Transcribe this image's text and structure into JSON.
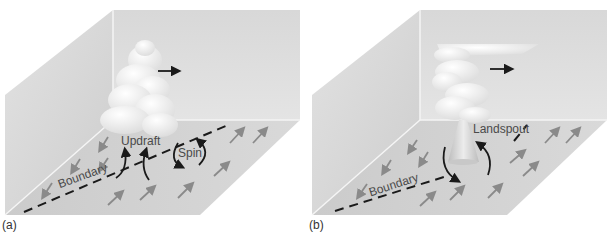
{
  "figure": {
    "panels": [
      {
        "id": "a",
        "letter": "(a)",
        "labels": {
          "boundary": "Boundary",
          "updraft": "Updraft",
          "spin": "Spin"
        }
      },
      {
        "id": "b",
        "letter": "(b)",
        "labels": {
          "boundary": "Boundary",
          "landspout": "Landspout"
        }
      }
    ]
  },
  "colors": {
    "wall_back": "#dcdcdc",
    "wall_side": "#d2d2d2",
    "floor": "#cfcfcf",
    "wind_arrow": "#8a8a8a",
    "line_dark": "#1a1a1a",
    "cloud": "#f4f4f4"
  }
}
